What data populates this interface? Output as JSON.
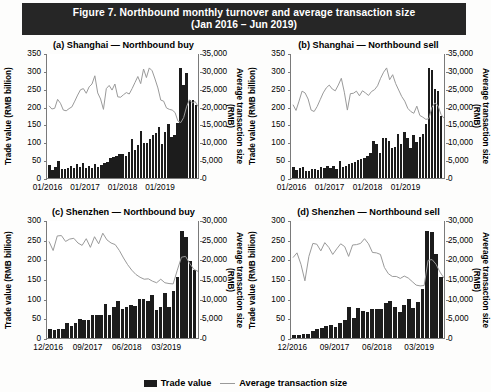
{
  "figure": {
    "title_line1": "Figure 7.  Northbound monthly turnover and average transaction size",
    "title_line2": "(Jan 2016 – Jun 2019)",
    "banner_color": "#262626"
  },
  "legend": {
    "items": [
      {
        "label": "Trade value",
        "marker": "bar",
        "color": "#1c1c1c"
      },
      {
        "label": "Average transaction size",
        "marker": "line",
        "color": "#9a9a9a"
      }
    ]
  },
  "axis_titles": {
    "left": "Trade value (RMB billion)",
    "right": "Average transaction size\n(RMB)"
  },
  "chart_data": [
    {
      "type": "bar",
      "panel": "a",
      "title": "(a) Shanghai — Northbound buy",
      "xlabel": "",
      "ylabel": "Trade value (RMB billion)",
      "y2label": "Average transaction size (RMB)",
      "ylim": [
        0,
        350
      ],
      "yticks": [
        "0",
        "50",
        "100",
        "150",
        "200",
        "250",
        "300",
        "350"
      ],
      "y2lim": [
        0,
        35000
      ],
      "y2ticks": [
        "0",
        "5,000",
        "10,000",
        "15,000",
        "20,000",
        "25,000",
        "30,000",
        "35,000"
      ],
      "xticks": [
        "01/2016",
        "01/2017",
        "01/2018",
        "01/2019"
      ],
      "xtick_index": [
        0,
        12,
        24,
        36
      ],
      "grid": false,
      "legend_position": "bottom",
      "x": [
        "01/2016",
        "02/2016",
        "03/2016",
        "04/2016",
        "05/2016",
        "06/2016",
        "07/2016",
        "08/2016",
        "09/2016",
        "10/2016",
        "11/2016",
        "12/2016",
        "01/2017",
        "02/2017",
        "03/2017",
        "04/2017",
        "05/2017",
        "06/2017",
        "07/2017",
        "08/2017",
        "09/2017",
        "10/2017",
        "11/2017",
        "12/2017",
        "01/2018",
        "02/2018",
        "03/2018",
        "04/2018",
        "05/2018",
        "06/2018",
        "07/2018",
        "08/2018",
        "09/2018",
        "10/2018",
        "11/2018",
        "12/2018",
        "01/2019",
        "02/2019",
        "03/2019",
        "04/2019",
        "05/2019",
        "06/2019"
      ],
      "series": [
        {
          "name": "Trade value",
          "axis": "left",
          "type": "bar",
          "color": "#1c1c1c",
          "values": [
            36,
            22,
            30,
            47,
            25,
            24,
            28,
            33,
            27,
            38,
            30,
            41,
            28,
            33,
            27,
            38,
            31,
            37,
            41,
            45,
            55,
            58,
            63,
            66,
            67,
            63,
            72,
            110,
            78,
            92,
            133,
            97,
            99,
            108,
            121,
            127,
            143,
            96,
            130,
            152,
            116,
            120,
            155,
            307,
            260,
            295,
            218,
            218,
            204
          ]
        },
        {
          "name": "Average transaction size",
          "axis": "right",
          "type": "line",
          "color": "#9a9a9a",
          "values": [
            20500,
            19600,
            19800,
            22300,
            21200,
            19300,
            19100,
            19700,
            20200,
            21800,
            23500,
            25000,
            25300,
            24000,
            25800,
            26600,
            28900,
            24100,
            22400,
            19500,
            25300,
            26200,
            24900,
            26600,
            23000,
            22900,
            23600,
            24200,
            23800,
            25300,
            27000,
            28700,
            26700,
            30800,
            28400,
            31100,
            30300,
            28000,
            25500,
            22100,
            21800,
            19900,
            19500,
            19300,
            18600,
            16200,
            15800,
            17200,
            20200,
            22200,
            21300,
            21700,
            20300
          ]
        }
      ]
    },
    {
      "type": "bar",
      "panel": "b",
      "title": "(b) Shanghai — Northbound sell",
      "ylabel": "Trade value (RMB billion)",
      "y2label": "Average transaction size (RMB)",
      "ylim": [
        0,
        350
      ],
      "yticks": [
        "0",
        "50",
        "100",
        "150",
        "200",
        "250",
        "300",
        "350"
      ],
      "y2lim": [
        0,
        35000
      ],
      "y2ticks": [
        "0",
        "5,000",
        "10,000",
        "15,000",
        "20,000",
        "25,000",
        "30,000",
        "35,000"
      ],
      "xticks": [
        "01/2016",
        "01/2017",
        "01/2018",
        "01/2019"
      ],
      "xtick_index": [
        0,
        12,
        24,
        36
      ],
      "grid": false,
      "series": [
        {
          "name": "Trade value",
          "axis": "left",
          "type": "bar",
          "color": "#1c1c1c",
          "values": [
            32,
            23,
            29,
            31,
            20,
            20,
            24,
            25,
            22,
            30,
            27,
            33,
            29,
            35,
            25,
            48,
            30,
            33,
            40,
            42,
            45,
            50,
            52,
            55,
            63,
            69,
            105,
            96,
            70,
            113,
            112,
            105,
            85,
            88,
            122,
            95,
            128,
            112,
            85,
            120,
            102,
            114,
            124,
            151,
            307,
            303,
            250,
            243,
            175
          ]
        },
        {
          "name": "Average transaction size",
          "axis": "right",
          "type": "line",
          "color": "#9a9a9a",
          "values": [
            20800,
            19200,
            21800,
            24600,
            24100,
            22400,
            19300,
            18900,
            20300,
            22200,
            24100,
            25500,
            26300,
            25200,
            24700,
            26300,
            28200,
            24300,
            19300,
            23900,
            24000,
            24600,
            23300,
            24700,
            24100,
            23400,
            24500,
            25000,
            26100,
            28200,
            29900,
            31100,
            27800,
            29200,
            26700,
            24900,
            23100,
            21800,
            19800,
            18900,
            18400,
            20400,
            17800,
            17300,
            16700,
            16900,
            20100,
            21300,
            20600,
            18100,
            17000
          ]
        }
      ]
    },
    {
      "type": "bar",
      "panel": "c",
      "title": "(c) Shenzhen — Northbound buy",
      "ylabel": "Trade value (RMB billion)",
      "y2label": "Average transaction size (RMB)",
      "ylim": [
        0,
        300
      ],
      "yticks": [
        "0",
        "50",
        "100",
        "150",
        "200",
        "250",
        "300"
      ],
      "y2lim": [
        0,
        30000
      ],
      "y2ticks": [
        "0",
        "5,000",
        "10,000",
        "15,000",
        "20,000",
        "25,000",
        "30,000"
      ],
      "xticks": [
        "12/2016",
        "09/2017",
        "06/2018",
        "03/2019"
      ],
      "xtick_index": [
        0,
        9,
        18,
        27
      ],
      "grid": false,
      "series": [
        {
          "name": "Trade value",
          "axis": "left",
          "type": "bar",
          "color": "#1c1c1c",
          "values": [
            22,
            21,
            24,
            23,
            37,
            31,
            39,
            48,
            47,
            47,
            58,
            58,
            58,
            86,
            59,
            80,
            93,
            73,
            80,
            84,
            82,
            98,
            98,
            95,
            110,
            72,
            78,
            114,
            80,
            119,
            155,
            273,
            258,
            195,
            172
          ]
        },
        {
          "name": "Average transaction size",
          "axis": "right",
          "type": "line",
          "color": "#9a9a9a",
          "values": [
            24800,
            22500,
            26200,
            26300,
            24800,
            25400,
            25600,
            24400,
            23800,
            25500,
            23300,
            26000,
            24200,
            26900,
            25200,
            24400,
            24000,
            22500,
            20600,
            18900,
            17500,
            16400,
            15700,
            15200,
            15300,
            14700,
            14300,
            15200,
            14300,
            14100,
            14000,
            17500,
            20800,
            21000,
            19200,
            17700,
            17200
          ]
        }
      ]
    },
    {
      "type": "bar",
      "panel": "d",
      "title": "(d) Shenzhen — Northbound sell",
      "ylabel": "Trade value (RMB billion)",
      "y2label": "Average transaction size (RMB)",
      "ylim": [
        0,
        300
      ],
      "yticks": [
        "0",
        "50",
        "100",
        "150",
        "200",
        "250",
        "300"
      ],
      "y2lim": [
        0,
        30000
      ],
      "y2ticks": [
        "0",
        "5,000",
        "10,000",
        "15,000",
        "20,000",
        "25,000",
        "30,000"
      ],
      "xticks": [
        "12/2016",
        "09/2017",
        "06/2018",
        "03/2019"
      ],
      "xtick_index": [
        0,
        9,
        18,
        27
      ],
      "grid": false,
      "series": [
        {
          "name": "Trade value",
          "axis": "left",
          "type": "bar",
          "color": "#1c1c1c",
          "values": [
            7,
            8,
            9,
            10,
            19,
            22,
            26,
            30,
            32,
            29,
            38,
            45,
            78,
            52,
            77,
            68,
            65,
            75,
            74,
            75,
            88,
            95,
            78,
            65,
            85,
            100,
            77,
            92,
            124,
            271,
            270,
            214,
            155
          ]
        },
        {
          "name": "Average transaction size",
          "axis": "right",
          "type": "line",
          "color": "#9a9a9a",
          "values": [
            20700,
            21900,
            19000,
            14800,
            21000,
            24300,
            24100,
            22400,
            24500,
            23300,
            21500,
            22900,
            24200,
            23500,
            21000,
            23900,
            24000,
            24300,
            25500,
            24200,
            22000,
            21900,
            21500,
            18200,
            16600,
            15900,
            15900,
            15400,
            16000,
            15500,
            14600,
            13700,
            13500,
            13600,
            20000,
            20200,
            19000,
            17000,
            15500
          ]
        }
      ]
    }
  ]
}
